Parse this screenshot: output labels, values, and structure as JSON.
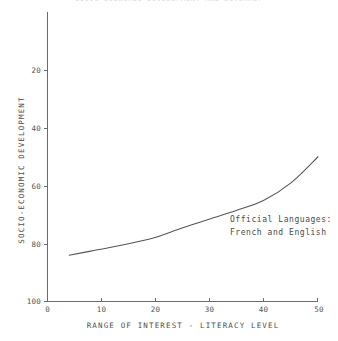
{
  "clipped_title": "SOCIO-ECONOMIC DEVELOPMENT AND LITERACY",
  "chart_data": {
    "type": "line",
    "title": "",
    "xlabel": "RANGE OF INTEREST - LITERACY LEVEL",
    "ylabel": "SOCIO-ECONOMIC DEVELOPMENT",
    "xlim": [
      0,
      50
    ],
    "ylim": [
      0,
      100
    ],
    "y_inverted": true,
    "grid": false,
    "legend": "none",
    "xticks": [
      0,
      10,
      20,
      30,
      40,
      50
    ],
    "xtick_labels": [
      "0",
      "10",
      "20",
      "30",
      "40",
      "50"
    ],
    "yticks": [
      20,
      40,
      60,
      80,
      100
    ],
    "ytick_labels": [
      "20",
      "40",
      "60",
      "80",
      "100"
    ],
    "series": [
      {
        "name": "socio-economic development curve",
        "x": [
          4,
          8,
          12,
          16,
          20,
          25,
          30,
          35,
          40,
          45,
          50
        ],
        "y": [
          84,
          82.6,
          81.2,
          79.6,
          77.8,
          74.5,
          71.5,
          68.5,
          65,
          59,
          50
        ]
      }
    ],
    "annotations": [
      {
        "name": "official-languages-note",
        "line1": "Official Languages:",
        "line2": "French and English",
        "x": 32,
        "y": 76
      }
    ],
    "colors": {
      "curve": "#555555",
      "axis": "#6b6b6b",
      "background": "#ffffff",
      "text": "#4a4a4a"
    }
  }
}
